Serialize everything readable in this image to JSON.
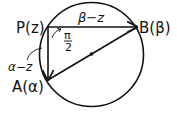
{
  "diagram": {
    "points": {
      "P": {
        "label": "P(z)",
        "x": 48,
        "y": 27
      },
      "A": {
        "label": "A(α)",
        "x": 48,
        "y": 80
      },
      "B": {
        "label": "B(β)",
        "x": 137,
        "y": 27
      }
    },
    "center": {
      "x": 91.5,
      "y": 54.5,
      "radius": 52
    },
    "vector_labels": {
      "PB": "β−z",
      "PA": "α−z"
    },
    "angle_label": {
      "numerator": "π",
      "denominator": "2"
    },
    "stroke_color": "#111111",
    "background": "#ffffff"
  }
}
